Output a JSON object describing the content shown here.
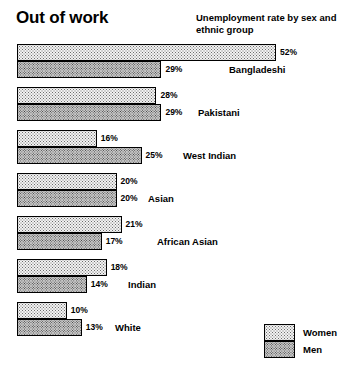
{
  "header": {
    "title": "Out of work",
    "subtitle": "Unemployment rate by sex and ethnic group"
  },
  "legend": {
    "women_label": "Women",
    "men_label": "Men"
  },
  "chart_data": {
    "type": "bar",
    "orientation": "horizontal",
    "title": "Out of work",
    "subtitle": "Unemployment rate by sex and ethnic group",
    "xlabel": "",
    "ylabel": "",
    "unit": "%",
    "xlim": [
      0,
      52
    ],
    "grid": false,
    "legend_position": "bottom-right",
    "categories": [
      "Bangladeshi",
      "Pakistani",
      "West Indian",
      "Asian",
      "African Asian",
      "Indian",
      "White"
    ],
    "series": [
      {
        "name": "Women",
        "values": [
          52,
          28,
          16,
          20,
          21,
          18,
          10
        ]
      },
      {
        "name": "Men",
        "values": [
          29,
          29,
          25,
          20,
          17,
          14,
          13
        ]
      }
    ],
    "data_labels": {
      "Women": [
        "52%",
        "28%",
        "16%",
        "20%",
        "21%",
        "18%",
        "10%"
      ],
      "Men": [
        "29%",
        "29%",
        "25%",
        "20%",
        "17%",
        "14%",
        "13%"
      ]
    },
    "groups": [
      {
        "label": "Bangladeshi",
        "label_x": 229,
        "women_value": 52,
        "women_label": "52%",
        "men_value": 29,
        "men_label": "29%"
      },
      {
        "label": "Pakistani",
        "label_x": 198,
        "women_value": 28,
        "women_label": "28%",
        "men_value": 29,
        "men_label": "29%"
      },
      {
        "label": "West Indian",
        "label_x": 183,
        "women_value": 16,
        "women_label": "16%",
        "men_value": 25,
        "men_label": "25%"
      },
      {
        "label": "Asian",
        "label_x": 148,
        "women_value": 20,
        "women_label": "20%",
        "men_value": 20,
        "men_label": "20%"
      },
      {
        "label": "African Asian",
        "label_x": 157,
        "women_value": 21,
        "women_label": "21%",
        "men_value": 17,
        "men_label": "17%"
      },
      {
        "label": "Indian",
        "label_x": 128,
        "women_value": 18,
        "women_label": "18%",
        "men_value": 14,
        "men_label": "14%"
      },
      {
        "label": "White",
        "label_x": 115,
        "women_value": 10,
        "women_label": "10%",
        "men_value": 13,
        "men_label": "13%"
      }
    ]
  }
}
